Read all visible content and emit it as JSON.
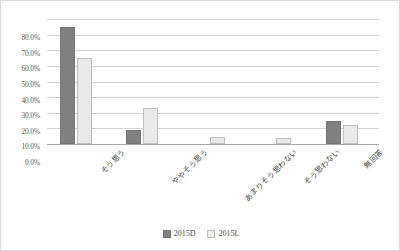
{
  "chart_data": {
    "type": "bar",
    "title": "",
    "subtitle": "",
    "xlabel": "",
    "ylabel": "",
    "ylim": [
      0,
      80
    ],
    "ytick_labels": [
      "80.0%",
      "70.0%",
      "60.0%",
      "50.0%",
      "40.0%",
      "30.0%",
      "20.0%",
      "10.0%",
      "0.0%"
    ],
    "ytick_values": [
      80,
      70,
      60,
      50,
      40,
      30,
      20,
      10,
      0
    ],
    "grid": true,
    "legend_position": "bottom-center",
    "categories": [
      "そう思う",
      "ややそう思う",
      "あまりそう思わない",
      "そう思わない",
      "無回答"
    ],
    "series": [
      {
        "name": "2015D",
        "color": "#808080",
        "values": [
          75.0,
          9.0,
          0.0,
          0.0,
          15.0
        ]
      },
      {
        "name": "2015L",
        "color": "#e9e9e9",
        "values": [
          55.0,
          23.0,
          4.5,
          4.0,
          12.0
        ]
      }
    ]
  },
  "legend": {
    "items": [
      {
        "label": "2015D",
        "style": "d"
      },
      {
        "label": "2015L",
        "style": "l"
      }
    ]
  }
}
